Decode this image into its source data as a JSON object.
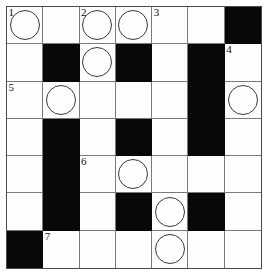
{
  "puzzle": {
    "title": "Crossword Grid",
    "rows": 7,
    "columns": 7,
    "colors": {
      "block": "#080808",
      "cell": "#fefefe",
      "grid_line": "#7a7a7a",
      "border": "#4a4a4a",
      "number": "#111111",
      "circle": "#3a3a3a"
    },
    "clue_numbers": [
      1,
      2,
      3,
      4,
      5,
      6,
      7
    ],
    "grid": [
      [
        {
          "type": "open",
          "number": "1",
          "circle": true,
          "letter": ""
        },
        {
          "type": "open",
          "number": "",
          "circle": false,
          "letter": ""
        },
        {
          "type": "open",
          "number": "2",
          "circle": true,
          "letter": ""
        },
        {
          "type": "open",
          "number": "",
          "circle": true,
          "letter": ""
        },
        {
          "type": "open",
          "number": "3",
          "circle": false,
          "letter": ""
        },
        {
          "type": "open",
          "number": "",
          "circle": false,
          "letter": ""
        },
        {
          "type": "block",
          "number": "",
          "circle": false,
          "letter": ""
        }
      ],
      [
        {
          "type": "open",
          "number": "",
          "circle": false,
          "letter": ""
        },
        {
          "type": "block",
          "number": "",
          "circle": false,
          "letter": ""
        },
        {
          "type": "open",
          "number": "",
          "circle": true,
          "letter": ""
        },
        {
          "type": "block",
          "number": "",
          "circle": false,
          "letter": ""
        },
        {
          "type": "open",
          "number": "",
          "circle": false,
          "letter": ""
        },
        {
          "type": "block",
          "number": "",
          "circle": false,
          "letter": ""
        },
        {
          "type": "open",
          "number": "4",
          "circle": false,
          "letter": ""
        }
      ],
      [
        {
          "type": "open",
          "number": "5",
          "circle": false,
          "letter": ""
        },
        {
          "type": "open",
          "number": "",
          "circle": true,
          "letter": ""
        },
        {
          "type": "open",
          "number": "",
          "circle": false,
          "letter": ""
        },
        {
          "type": "open",
          "number": "",
          "circle": false,
          "letter": ""
        },
        {
          "type": "open",
          "number": "",
          "circle": false,
          "letter": ""
        },
        {
          "type": "block",
          "number": "",
          "circle": false,
          "letter": ""
        },
        {
          "type": "open",
          "number": "",
          "circle": true,
          "letter": ""
        }
      ],
      [
        {
          "type": "open",
          "number": "",
          "circle": false,
          "letter": ""
        },
        {
          "type": "block",
          "number": "",
          "circle": false,
          "letter": ""
        },
        {
          "type": "open",
          "number": "",
          "circle": false,
          "letter": ""
        },
        {
          "type": "block",
          "number": "",
          "circle": false,
          "letter": ""
        },
        {
          "type": "open",
          "number": "",
          "circle": false,
          "letter": ""
        },
        {
          "type": "block",
          "number": "",
          "circle": false,
          "letter": ""
        },
        {
          "type": "open",
          "number": "",
          "circle": false,
          "letter": ""
        }
      ],
      [
        {
          "type": "open",
          "number": "",
          "circle": false,
          "letter": ""
        },
        {
          "type": "block",
          "number": "",
          "circle": false,
          "letter": ""
        },
        {
          "type": "open",
          "number": "6",
          "circle": false,
          "letter": ""
        },
        {
          "type": "open",
          "number": "",
          "circle": true,
          "letter": ""
        },
        {
          "type": "open",
          "number": "",
          "circle": false,
          "letter": ""
        },
        {
          "type": "open",
          "number": "",
          "circle": false,
          "letter": ""
        },
        {
          "type": "open",
          "number": "",
          "circle": false,
          "letter": ""
        }
      ],
      [
        {
          "type": "open",
          "number": "",
          "circle": false,
          "letter": ""
        },
        {
          "type": "block",
          "number": "",
          "circle": false,
          "letter": ""
        },
        {
          "type": "open",
          "number": "",
          "circle": false,
          "letter": ""
        },
        {
          "type": "block",
          "number": "",
          "circle": false,
          "letter": ""
        },
        {
          "type": "open",
          "number": "",
          "circle": true,
          "letter": ""
        },
        {
          "type": "block",
          "number": "",
          "circle": false,
          "letter": ""
        },
        {
          "type": "open",
          "number": "",
          "circle": false,
          "letter": ""
        }
      ],
      [
        {
          "type": "block",
          "number": "",
          "circle": false,
          "letter": ""
        },
        {
          "type": "open",
          "number": "7",
          "circle": false,
          "letter": ""
        },
        {
          "type": "open",
          "number": "",
          "circle": false,
          "letter": ""
        },
        {
          "type": "open",
          "number": "",
          "circle": false,
          "letter": ""
        },
        {
          "type": "open",
          "number": "",
          "circle": true,
          "letter": ""
        },
        {
          "type": "open",
          "number": "",
          "circle": false,
          "letter": ""
        },
        {
          "type": "open",
          "number": "",
          "circle": false,
          "letter": ""
        }
      ]
    ]
  }
}
